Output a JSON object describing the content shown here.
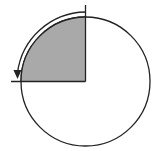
{
  "diagram": {
    "type": "circle-quarter-rotation",
    "circle": {
      "cx": 85.5,
      "cy": 81.5,
      "r": 64.5,
      "stroke": "#222222",
      "fill": "#ffffff"
    },
    "quadrant": {
      "fill": "#a9a9a9",
      "stroke": "#222222",
      "position": "upper-left"
    },
    "rotation_arrow": {
      "direction": "counterclockwise",
      "radius": 69,
      "from": "top",
      "to": "left",
      "stroke": "#222222"
    },
    "axes": {
      "vertical_top_y": 5,
      "horizontal_left_x": 11
    }
  }
}
